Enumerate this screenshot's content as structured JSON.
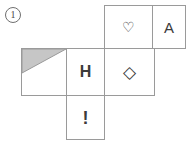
{
  "figure": {
    "label": "①",
    "label_text": "1",
    "caption": "",
    "kind": "cube-net",
    "stroke_color": "#9a9a9a",
    "shade_color": "#c6c6c6",
    "background": "#ffffff"
  },
  "net": {
    "rows": [
      {
        "name": "top-row",
        "cells": [
          {
            "name": "heart-face",
            "symbol": "♡",
            "icon": "heart-outline-icon",
            "shaded": false
          },
          {
            "name": "letter-a-face",
            "symbol": "A",
            "icon": "letter-a-icon",
            "shaded": false
          }
        ]
      },
      {
        "name": "middle-row",
        "cells": [
          {
            "name": "shaded-face",
            "symbol": "",
            "icon": "shaded-triangle-icon",
            "shaded": true
          },
          {
            "name": "letter-h-face",
            "symbol": "H",
            "icon": "letter-h-icon",
            "shaded": false
          },
          {
            "name": "diamond-face",
            "symbol": "◇",
            "icon": "diamond-outline-icon",
            "shaded": false
          }
        ]
      },
      {
        "name": "bottom-row",
        "cells": [
          {
            "name": "exclamation-face",
            "symbol": "!",
            "icon": "exclamation-icon",
            "shaded": false
          }
        ]
      }
    ],
    "shaded_triangle": {
      "name": "corner-shading",
      "description": "gray right triangle in upper-left of leftmost face",
      "color": "#c6c6c6"
    }
  }
}
